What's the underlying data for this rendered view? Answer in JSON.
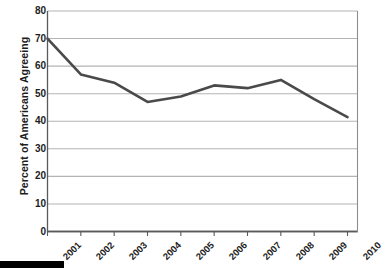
{
  "chart_data": {
    "type": "line",
    "title": "",
    "xlabel": "",
    "ylabel": "Percent of Americans Agreeing",
    "categories": [
      "2001",
      "2002",
      "2003",
      "2004",
      "2005",
      "2006",
      "2007",
      "2008",
      "2009",
      "2010"
    ],
    "values": [
      70,
      57,
      54,
      47,
      49,
      53,
      52,
      55,
      48,
      41.5
    ],
    "series": [
      {
        "name": "Percent of Americans Agreeing",
        "values": [
          70,
          57,
          54,
          47,
          49,
          53,
          52,
          55,
          48,
          41.5
        ]
      }
    ],
    "ylim": [
      0,
      80
    ],
    "yticks": [
      0,
      10,
      20,
      30,
      40,
      50,
      60,
      70,
      80
    ],
    "ytick_labels": [
      "0",
      "10",
      "20",
      "30",
      "40",
      "50",
      "60",
      "70",
      "80"
    ],
    "xtick_labels": [
      "2001",
      "2002",
      "2003",
      "2004",
      "2005",
      "2006",
      "2007",
      "2008",
      "2009",
      "2010"
    ],
    "grid": true,
    "grid_axis": "y",
    "legend": false,
    "legend_position": "none",
    "line_color": "#4a4a4a",
    "grid_color": "#b4b4b4",
    "axis_color": "#5a5a5a",
    "text_color": "#1d1d1d",
    "background": "#ffffff",
    "xtick_rotation": -45
  },
  "artifacts": {
    "scan_bar_color": "#000000"
  }
}
